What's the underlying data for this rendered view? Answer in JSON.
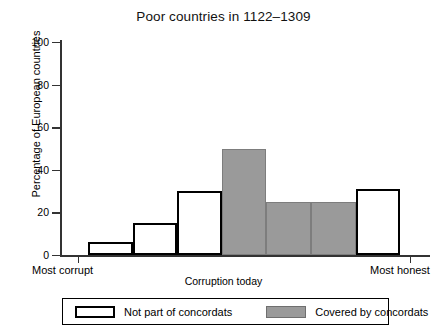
{
  "chart_data": {
    "type": "bar",
    "title": "Poor countries in 1122–1309",
    "xlabel": "Corruption today",
    "ylabel": "Percentage of European countries",
    "ylim": [
      0,
      100
    ],
    "yticks": [
      0,
      20,
      40,
      60,
      80,
      100
    ],
    "ytick_labels": [
      "0",
      "20",
      "40",
      "60",
      "80",
      "100"
    ],
    "grid": false,
    "x_axis_end_labels": {
      "left": "Most corrupt",
      "right": "Most honest"
    },
    "categories": [
      "1",
      "2",
      "3",
      "4",
      "5",
      "6",
      "7"
    ],
    "values": [
      6,
      15,
      30,
      50,
      25,
      25,
      31
    ],
    "bar_styles": [
      "open",
      "open",
      "open",
      "filled",
      "filled",
      "filled",
      "open"
    ],
    "legend": {
      "position": "below-axes",
      "entries": [
        {
          "label": "Not part of concordats",
          "style": "open",
          "color": "#ffffff",
          "edge": "#000000"
        },
        {
          "label": "Covered by concordats",
          "style": "filled",
          "color": "#9a9a9a",
          "edge": "#7d7d7d"
        }
      ]
    },
    "colors": {
      "fill_gray": "#9a9a9a",
      "fill_white": "#ffffff",
      "axis": "#333333",
      "text": "#000000"
    }
  }
}
